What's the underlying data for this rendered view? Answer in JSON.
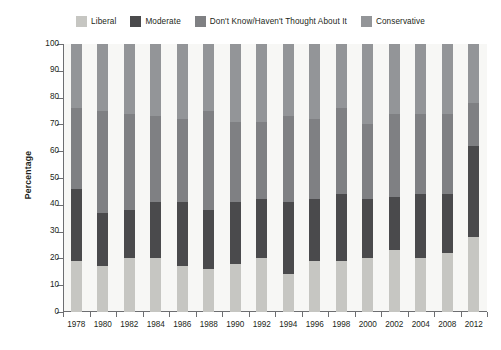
{
  "chart_data": {
    "type": "bar",
    "subtype": "stacked-column-100",
    "title": "",
    "xlabel": "",
    "ylabel": "Percentage",
    "ylim": [
      0,
      100
    ],
    "ytick_step": 10,
    "yticks": [
      0,
      10,
      20,
      30,
      40,
      50,
      60,
      70,
      80,
      90,
      100
    ],
    "grid": false,
    "legend_position": "top",
    "categories": [
      "1978",
      "1980",
      "1982",
      "1984",
      "1986",
      "1988",
      "1990",
      "1992",
      "1994",
      "1996",
      "1998",
      "2000",
      "2002",
      "2004",
      "2008",
      "2012"
    ],
    "series": [
      {
        "name": "Liberal",
        "color": "#c6c6c2",
        "values": [
          19,
          17,
          20,
          20,
          17,
          16,
          18,
          20,
          14,
          19,
          19,
          20,
          23,
          20,
          22,
          28
        ]
      },
      {
        "name": "Moderate",
        "color": "#4a4a4c",
        "values": [
          27,
          20,
          18,
          21,
          24,
          22,
          23,
          22,
          27,
          23,
          25,
          22,
          20,
          24,
          22,
          34
        ]
      },
      {
        "name": "Don't Know/Haven't Thought About It",
        "color": "#7f8083",
        "values": [
          30,
          38,
          36,
          32,
          31,
          37,
          30,
          29,
          32,
          30,
          32,
          28,
          31,
          30,
          30,
          16
        ]
      },
      {
        "name": "Conservative",
        "color": "#939598",
        "values": [
          24,
          25,
          26,
          27,
          28,
          25,
          29,
          29,
          27,
          28,
          24,
          30,
          26,
          26,
          26,
          22
        ]
      }
    ]
  },
  "legend": {
    "items": [
      {
        "label": "Liberal",
        "color": "#c6c6c2"
      },
      {
        "label": "Moderate",
        "color": "#4a4a4c"
      },
      {
        "label": "Don't Know/Haven't Thought About It",
        "color": "#7f8083"
      },
      {
        "label": "Conservative",
        "color": "#939598"
      }
    ]
  },
  "axes": {
    "y_title": "Percentage"
  }
}
